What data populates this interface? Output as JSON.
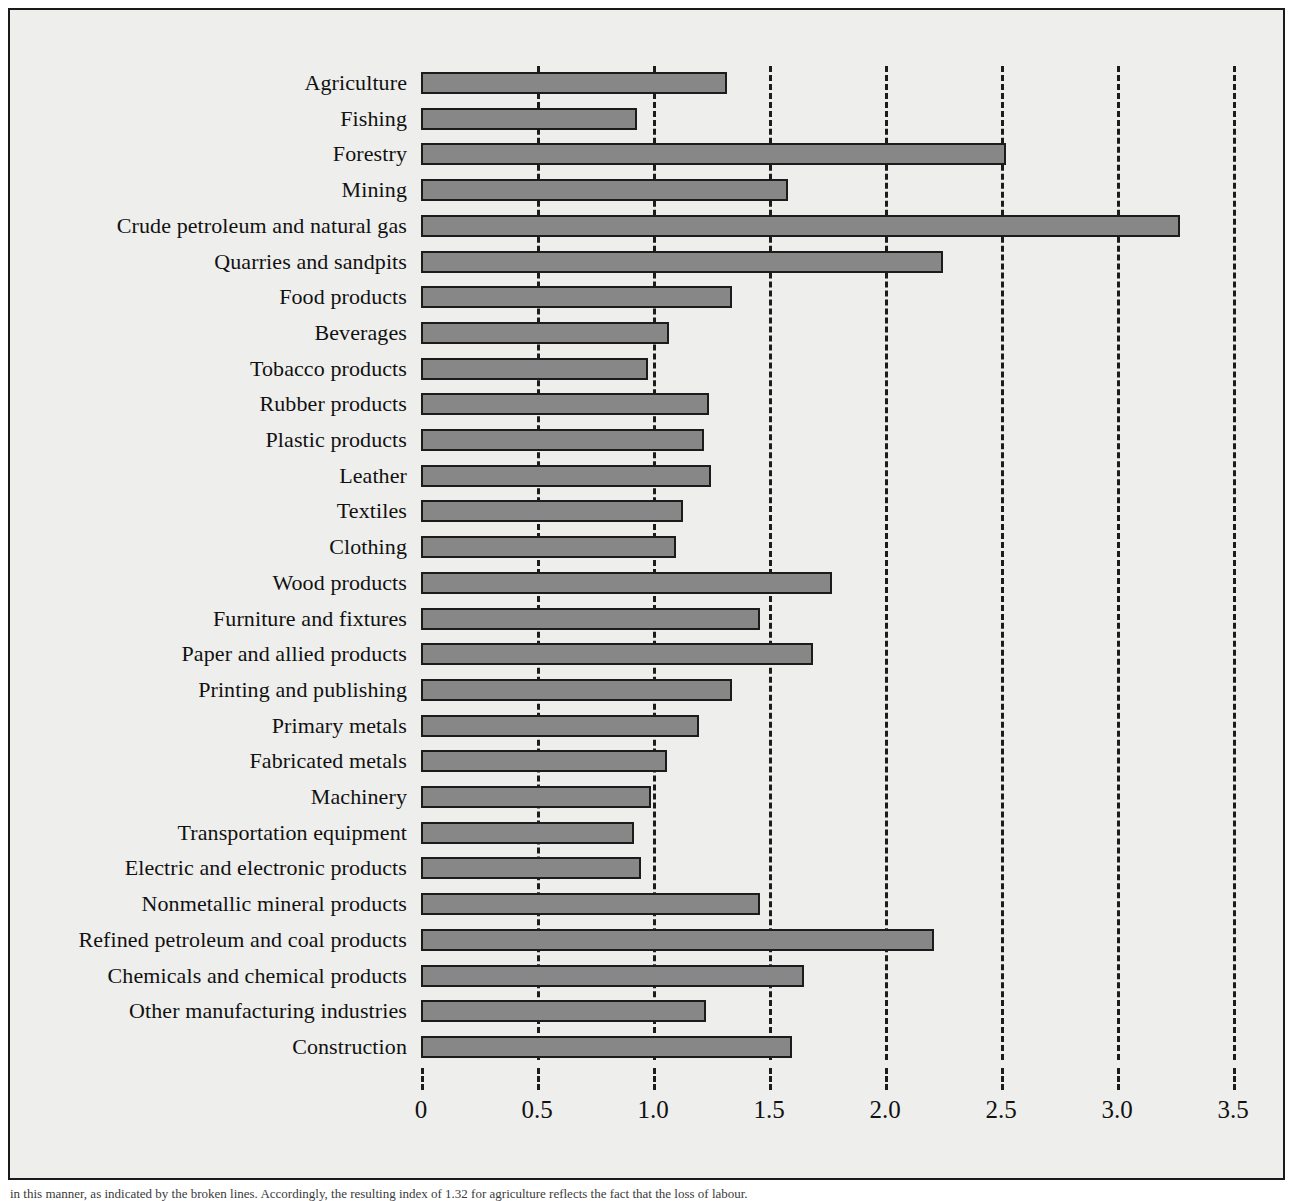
{
  "figure": {
    "background_color": "#eeeeec",
    "frame_color": "#1a1a1a",
    "bar_fill_color": "#878787",
    "bar_edge_color": "#1c1c1c",
    "caption_cut_off": "in this manner, as indicated by the broken lines. Accordingly, the resulting index of 1.32 for agriculture reflects the fact that the loss of labour."
  },
  "chart_data": {
    "type": "bar",
    "orientation": "horizontal",
    "title": "",
    "subtitle": "",
    "xlabel": "",
    "ylabel": "",
    "xlim": [
      0,
      3.5
    ],
    "grid": true,
    "grid_style": "dashed",
    "legend": null,
    "xticks": [
      0,
      0.5,
      1.0,
      1.5,
      2.0,
      2.5,
      3.0,
      3.5
    ],
    "xtick_labels": [
      "0",
      "0.5",
      "1.0",
      "1.5",
      "2.0",
      "2.5",
      "3.0",
      "3.5"
    ],
    "categories": [
      "Agriculture",
      "Fishing",
      "Forestry",
      "Mining",
      "Crude petroleum and natural gas",
      "Quarries and sandpits",
      "Food products",
      "Beverages",
      "Tobacco products",
      "Rubber products",
      "Plastic products",
      "Leather",
      "Textiles",
      "Clothing",
      "Wood products",
      "Furniture and fixtures",
      "Paper and allied products",
      "Printing and publishing",
      "Primary metals",
      "Fabricated metals",
      "Machinery",
      "Transportation equipment",
      "Electric and electronic products",
      "Nonmetallic mineral products",
      "Refined petroleum and coal products",
      "Chemicals and chemical products",
      "Other manufacturing industries",
      "Construction"
    ],
    "values": [
      1.32,
      0.93,
      2.52,
      1.58,
      3.27,
      2.25,
      1.34,
      1.07,
      0.98,
      1.24,
      1.22,
      1.25,
      1.13,
      1.1,
      1.77,
      1.46,
      1.69,
      1.34,
      1.2,
      1.06,
      0.99,
      0.92,
      0.95,
      1.46,
      2.21,
      1.65,
      1.23,
      1.6
    ]
  }
}
